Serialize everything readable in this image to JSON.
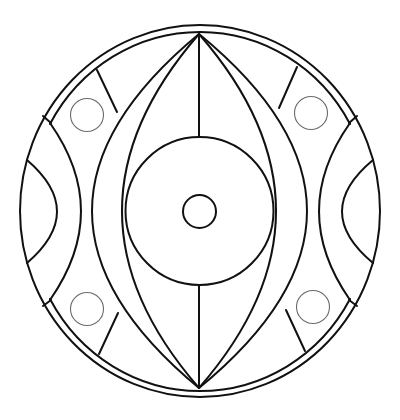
{
  "image": {
    "kind": "mandala coloring page",
    "description": "Black line-art circular mandala on white background with a central eye-like lens shape, concentric center circles, side half-moons, and four small circles in the outer band",
    "colors": {
      "background": "#ffffff",
      "line": "#111111",
      "small_circle_line": "#6a6a6a"
    },
    "elements": {
      "outer_ring": {
        "center": [
          200,
          211
        ],
        "rx": 180,
        "ry": 186
      },
      "inner_ring": {
        "center": [
          200,
          211
        ],
        "rx": 171,
        "ry": 177
      },
      "middle_circle": {
        "center": [
          199.5,
          211
        ],
        "r": 74
      },
      "center_circle": {
        "center": [
          199.5,
          211.5
        ],
        "r": 16.5
      },
      "small_circles": [
        {
          "position": "top-left",
          "center": [
            87,
            115
          ],
          "r": 16.5
        },
        {
          "position": "top-right",
          "center": [
            311,
            113
          ],
          "r": 16.5
        },
        {
          "position": "bottom-left",
          "center": [
            87,
            309
          ],
          "r": 16.5
        },
        {
          "position": "bottom-right",
          "center": [
            313,
            307
          ],
          "r": 16.5
        }
      ],
      "lens_count": 2,
      "side_half_moons": 2
    }
  }
}
